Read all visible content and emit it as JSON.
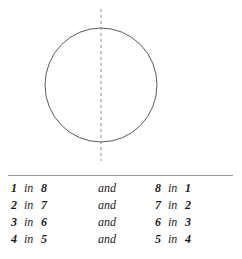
{
  "figure": {
    "shape_name": "circle",
    "circle": {
      "center_x": 101,
      "center_y": 85,
      "radius_x": 56,
      "radius_y": 57,
      "stroke_color": "#5a5a5a"
    },
    "symmetry_line": {
      "name": "vertical-axis-of-symmetry",
      "x": 101,
      "y_start": 9,
      "y_end": 161,
      "dash": "3 3",
      "stroke_color": "#8a8a8a"
    }
  },
  "pairs_table": {
    "connector_label": "and",
    "relation_label": "in",
    "rows": [
      {
        "left_first": "1",
        "left_second": "8",
        "right_first": "8",
        "right_second": "1"
      },
      {
        "left_first": "2",
        "left_second": "7",
        "right_first": "7",
        "right_second": "2"
      },
      {
        "left_first": "3",
        "left_second": "6",
        "right_first": "6",
        "right_second": "3"
      },
      {
        "left_first": "4",
        "left_second": "5",
        "right_first": "5",
        "right_second": "4"
      }
    ],
    "rule_color": "#9a9a9a"
  }
}
